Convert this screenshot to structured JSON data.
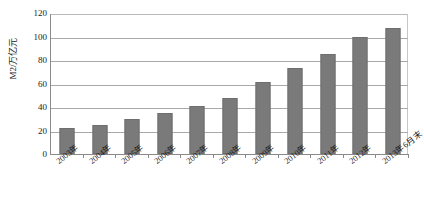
{
  "chart_data": {
    "type": "bar",
    "title": "",
    "xlabel": "",
    "ylabel": "M2/万亿元",
    "ylim": [
      0,
      120
    ],
    "ytick_values": [
      0,
      20,
      40,
      60,
      80,
      100,
      120
    ],
    "ytick_labels": [
      "0",
      "20",
      "40",
      "60",
      "80",
      "100",
      "120"
    ],
    "grid": true,
    "legend": false,
    "legend_position": "none",
    "categories": [
      "2003年",
      "2004年",
      "2005年",
      "2006年",
      "2007年",
      "2008年",
      "2009年",
      "2010年",
      "2011年",
      "2012年",
      "2013年6月末"
    ],
    "values": [
      22,
      25,
      30,
      35,
      41,
      48,
      61,
      73.5,
      85.5,
      99.5,
      107
    ],
    "series": [
      {
        "name": "M2",
        "values": [
          22,
          25,
          30,
          35,
          41,
          48,
          61,
          73.5,
          85.5,
          99.5,
          107
        ]
      }
    ],
    "bar_color": "#7a7a7a",
    "axis_color": "#8a8a8a",
    "gridline_color": "#a9a9a9"
  },
  "caption": {
    "text": ""
  }
}
